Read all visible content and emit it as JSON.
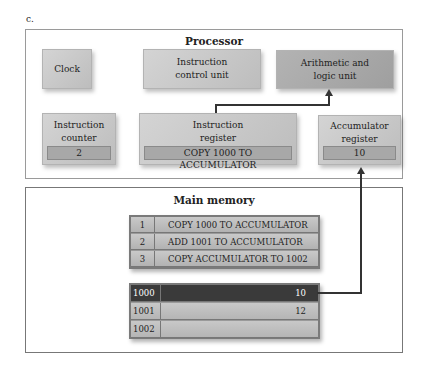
{
  "figure_label": "c.",
  "processor": {
    "title": "Processor",
    "clock": "Clock",
    "instruction_control_unit": "Instruction control unit",
    "alu": "Arithmetic and logic unit",
    "instruction_counter": {
      "label": "Instruction counter",
      "value": "2"
    },
    "instruction_register": {
      "label": "Instruction register",
      "value": "COPY 1000 TO ACCUMULATOR"
    },
    "accumulator_register": {
      "label": "Accumulator register",
      "value": "10"
    }
  },
  "main_memory": {
    "title": "Main memory",
    "program": [
      {
        "n": "1",
        "instr": "COPY 1000 TO ACCUMULATOR"
      },
      {
        "n": "2",
        "instr": "ADD 1001 TO ACCUMULATOR"
      },
      {
        "n": "3",
        "instr": "COPY ACCUMULATOR TO 1002"
      }
    ],
    "data": [
      {
        "addr": "1000",
        "value": "10"
      },
      {
        "addr": "1001",
        "value": "12"
      },
      {
        "addr": "1002",
        "value": ""
      }
    ]
  }
}
